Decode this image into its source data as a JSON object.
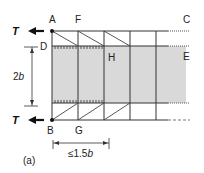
{
  "figure": {
    "caption": "(a)",
    "nodes": {
      "A": "A",
      "B": "B",
      "C": "C",
      "D": "D",
      "E": "E",
      "F": "F",
      "G": "G",
      "H": "H"
    },
    "forces": {
      "top": "T",
      "bottom": "T"
    },
    "dimensions": {
      "height": "2b",
      "height_var": "b",
      "height_coef": "2",
      "spacing": "≤1.5b",
      "spacing_prefix": "≤1.5",
      "spacing_var": "b"
    },
    "colors": {
      "line": "#333333",
      "shade": "#d9d9d9",
      "arrow": "#111111"
    }
  }
}
